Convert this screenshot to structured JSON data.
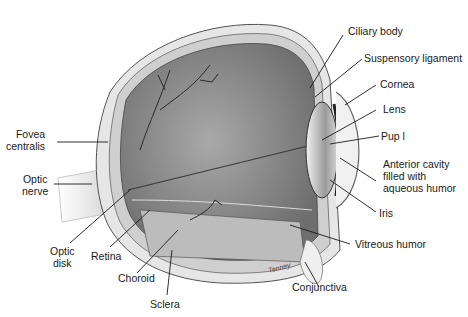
{
  "figure": {
    "labels": {
      "ciliary_body": "Ciliary body",
      "suspensory_ligament": "Suspensory ligament",
      "cornea": "Cornea",
      "lens": "Lens",
      "pupil": "Pup l",
      "anterior_cavity": "Anterior cavity\nfilled with\naqueous humor",
      "iris": "Iris",
      "vitreous_humor": "Vitreous humor",
      "conjunctiva": "Conjunctiva",
      "sclera": "Sclera",
      "choroid": "Choroid",
      "retina": "Retina",
      "optic_disk": "Optic\ndisk",
      "optic_nerve": "Optic\nnerve",
      "fovea_centralis": "Fovea\ncentralis"
    },
    "signature": "Tenney"
  }
}
